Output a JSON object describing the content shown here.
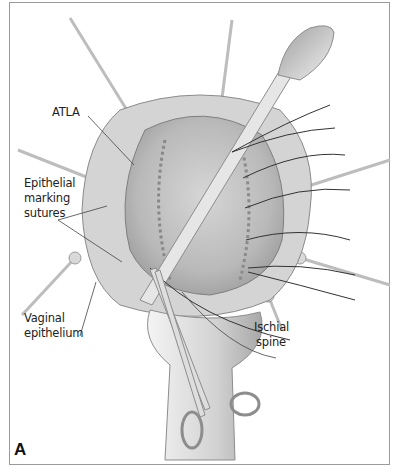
{
  "figure": {
    "panel_letter": "A",
    "labels": {
      "atla": "ATLA",
      "epithelial_line1": "Epithelial",
      "epithelial_line2": "marking",
      "epithelial_line3": "sutures",
      "vaginal_line1": "Vaginal",
      "vaginal_line2": "epithelium",
      "ischial_line1": "Ischial",
      "ischial_line2": "spine"
    },
    "colors": {
      "frame": "#9a9a9a",
      "tissue_light": "#dcdcdc",
      "tissue_mid": "#bdbdbd",
      "tissue_dark": "#8f8f8f",
      "instrument": "#cfcfcf",
      "suture": "#333333"
    }
  }
}
